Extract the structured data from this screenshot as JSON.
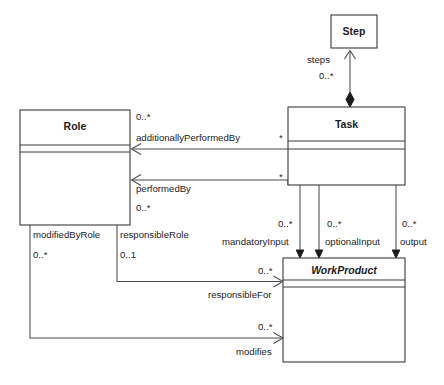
{
  "diagram": {
    "kind": "uml-class-diagram",
    "background": "#ffffff",
    "line_color": "#3a3a3a",
    "classes": [
      {
        "id": "step",
        "name": "Step",
        "abstract": false
      },
      {
        "id": "task",
        "name": "Task",
        "abstract": false
      },
      {
        "id": "role",
        "name": "Role",
        "abstract": false
      },
      {
        "id": "workproduct",
        "name": "WorkProduct",
        "abstract": true
      }
    ],
    "associations": [
      {
        "id": "steps",
        "role_label": "steps",
        "multiplicity": "0..*",
        "from": "task",
        "to": "step",
        "type": "composition"
      },
      {
        "id": "additionally-performed-by",
        "role_label": "additionallyPerformedBy",
        "multiplicity": "0..*",
        "multiplicity_far": "*",
        "from": "task",
        "to": "role",
        "type": "directed"
      },
      {
        "id": "performed-by",
        "role_label": "performedBy",
        "multiplicity": "0..*",
        "multiplicity_far": "*",
        "from": "task",
        "to": "role",
        "type": "directed"
      },
      {
        "id": "mandatory-input",
        "role_label": "mandatoryInput",
        "multiplicity": "0..*",
        "from": "task",
        "to": "workproduct",
        "type": "directed"
      },
      {
        "id": "optional-input",
        "role_label": "optionalInput",
        "multiplicity": "0..*",
        "from": "task",
        "to": "workproduct",
        "type": "directed"
      },
      {
        "id": "output",
        "role_label": "output",
        "multiplicity": "0..*",
        "from": "task",
        "to": "workproduct",
        "type": "directed"
      },
      {
        "id": "modified-by-role",
        "role_label": "modifiedByRole",
        "multiplicity": "0..*",
        "from": "role",
        "to": "workproduct",
        "type": "plain"
      },
      {
        "id": "responsible-role",
        "role_label": "responsibleRole",
        "multiplicity": "0..1",
        "from": "role",
        "to": "workproduct",
        "type": "plain"
      },
      {
        "id": "responsible-for",
        "role_label": "responsibleFor",
        "multiplicity": "0..*",
        "from": "role",
        "to": "workproduct",
        "type": "directed"
      },
      {
        "id": "modifies",
        "role_label": "modifies",
        "multiplicity": "0..*",
        "from": "role",
        "to": "workproduct",
        "type": "directed"
      }
    ]
  }
}
